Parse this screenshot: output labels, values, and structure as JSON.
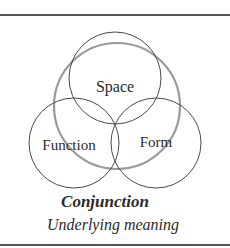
{
  "diagram": {
    "circles": [
      {
        "id": "space",
        "label": "Space",
        "cx": 115,
        "cy": 78,
        "r": 46,
        "stroke": "#4a4a4a"
      },
      {
        "id": "function",
        "label": "Function",
        "cx": 74,
        "cy": 143,
        "r": 45,
        "stroke": "#4a4a4a"
      },
      {
        "id": "form",
        "label": "Form",
        "cx": 156,
        "cy": 143,
        "r": 45,
        "stroke": "#4a4a4a"
      },
      {
        "id": "meaning",
        "label": "",
        "cx": 117,
        "cy": 106,
        "r": 63,
        "stroke": "#9a9a9a"
      }
    ],
    "labels": {
      "space": "Space",
      "function": "Function",
      "form": "Form"
    },
    "title": "Conjunction",
    "subtitle": "Underlying meaning"
  }
}
